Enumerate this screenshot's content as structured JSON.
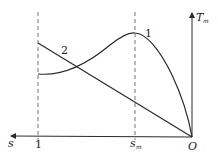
{
  "diagram": {
    "axes": {
      "x_label": "s",
      "y_label_main": "T",
      "y_label_sub": "m",
      "origin_label": "O",
      "x_ticks": [
        {
          "label": "1",
          "position": "s=1"
        },
        {
          "label_main": "s",
          "label_sub": "m",
          "position": "s=s_m"
        }
      ]
    },
    "curves": [
      {
        "id": "1",
        "label": "1",
        "description": "Nonlinear curve rising from s=1 to a peak at s_m then falling to zero at O"
      },
      {
        "id": "2",
        "label": "2",
        "description": "Straight line decreasing from s=1 to zero at O"
      }
    ],
    "guides": [
      {
        "style": "dashed",
        "at": "s=1"
      },
      {
        "style": "dashed",
        "at": "s=s_m"
      }
    ],
    "colors": {
      "line": "#2a2a2a",
      "dashed": "#777777",
      "background": "#ffffff"
    }
  }
}
